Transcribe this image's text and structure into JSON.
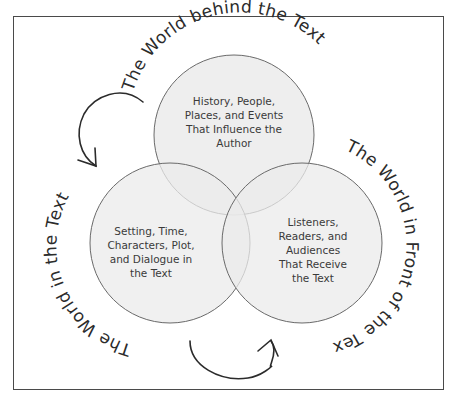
{
  "diagram": {
    "type": "venn",
    "circles": [
      {
        "id": "top",
        "arc_label": "The World behind the Text",
        "lines": [
          "History, People,",
          "Places, and Events",
          "That Influence the",
          "Author"
        ]
      },
      {
        "id": "left",
        "arc_label": "The World in the Text",
        "lines": [
          "Setting, Time,",
          "Characters, Plot,",
          "and Dialogue in",
          "the Text"
        ]
      },
      {
        "id": "right",
        "arc_label": "The World in Front of the Text",
        "lines": [
          "Listeners,",
          "Readers, and",
          "Audiences",
          "That Receive",
          "the Text"
        ]
      }
    ],
    "arrows": [
      {
        "id": "upper-left-arrow",
        "direction": "counterclockwise-down"
      },
      {
        "id": "bottom-arrow",
        "direction": "left-to-right-up"
      }
    ],
    "colors": {
      "circle_fill": "#e9e9e9",
      "circle_stroke": "#6a6a6a",
      "text": "#3a3a3a",
      "frame": "#4a4a4a",
      "arrow": "#2b2b2b"
    }
  }
}
